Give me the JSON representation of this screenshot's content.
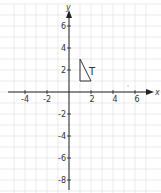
{
  "diagram": {
    "type": "coordinate-grid",
    "x_axis_label": "x",
    "y_axis_label": "y",
    "x_range": [
      -5.5,
      7.5
    ],
    "y_range": [
      -9,
      8
    ],
    "x_tick_labels": [
      "-4",
      "-2",
      "2",
      "4",
      "6"
    ],
    "x_tick_values": [
      -4,
      -2,
      2,
      4,
      6
    ],
    "y_tick_labels": [
      "6",
      "4",
      "2",
      "-2",
      "-4",
      "-6",
      "-8"
    ],
    "y_tick_values": [
      6,
      4,
      2,
      -2,
      -4,
      -6,
      -8
    ],
    "shape": {
      "label": "T",
      "vertices": [
        [
          1,
          1
        ],
        [
          1,
          3
        ],
        [
          2,
          1
        ]
      ]
    },
    "colors": {
      "axis": "#222222",
      "grid": "#e2e2e2",
      "shape": "#333333",
      "text": "#333333"
    }
  }
}
